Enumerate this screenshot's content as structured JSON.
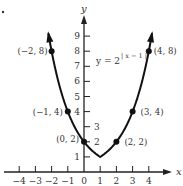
{
  "chart_data": {
    "type": "line",
    "title": "",
    "equation": {
      "lhs": "y = 2",
      "exponent": "| x − 1 |",
      "full": "y = 2^|x − 1|"
    },
    "xlabel": "x",
    "ylabel": "y",
    "xlim": [
      -4.5,
      5.5
    ],
    "ylim": [
      0,
      9.5
    ],
    "x_ticks": [
      -4,
      -3,
      -2,
      -1,
      0,
      1,
      2,
      3,
      4
    ],
    "x_tick_labels": [
      "−4",
      "−3",
      "−2",
      "−1",
      "0",
      "1",
      "2",
      "3",
      "4"
    ],
    "y_ticks": [
      1,
      2,
      3,
      4,
      5,
      6,
      7,
      8,
      9
    ],
    "y_tick_labels": [
      "1",
      "2",
      "3",
      "4",
      "5",
      "6",
      "7",
      "8",
      "9"
    ],
    "grid": false,
    "legend": null,
    "series": [
      {
        "name": "y = 2^|x − 1|",
        "function": "2^abs(x-1)",
        "x_range": [
          -2.2,
          4.2
        ],
        "color": "#111111"
      }
    ],
    "points": [
      {
        "x": -2,
        "y": 8,
        "label": "(−2, 8)"
      },
      {
        "x": -1,
        "y": 4,
        "label": "(−1, 4)"
      },
      {
        "x": 0,
        "y": 2,
        "label": "(0, 2)"
      },
      {
        "x": 2,
        "y": 2,
        "label": "(2, 2)"
      },
      {
        "x": 3,
        "y": 4,
        "label": "(3, 4)"
      },
      {
        "x": 4,
        "y": 8,
        "label": "(4, 8)"
      }
    ]
  },
  "colors": {
    "ink": "#111111",
    "text": "#333333",
    "background": "#ffffff"
  }
}
